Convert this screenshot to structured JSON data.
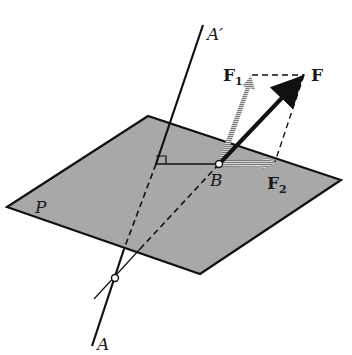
{
  "figure": {
    "plane_label": "P",
    "axis_top_label": "A′",
    "axis_bottom_label": "A",
    "point_label": "B",
    "force_label": "F",
    "component1_label": "F",
    "component1_sub": "1",
    "component2_label": "F",
    "component2_sub": "2"
  },
  "colors": {
    "plane_fill": "#a9a9a9",
    "line": "#111111",
    "background": "#ffffff",
    "component_hatch": "#8a8a8a"
  }
}
